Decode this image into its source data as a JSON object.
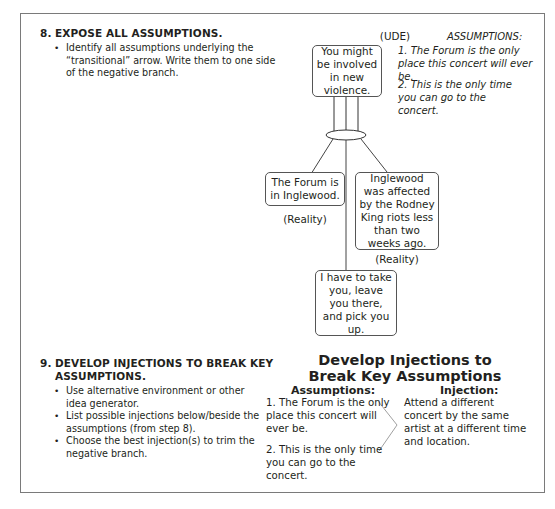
{
  "step8": {
    "number": "8.",
    "title": "EXPOSE ALL ASSUMPTIONS.",
    "bullets": [
      "Identify all assumptions underlying the “transitional” arrow. Write them to one side of the negative branch."
    ]
  },
  "diagram": {
    "ude_label": "(UDE)",
    "ude_box": "You might be involved in new violence.",
    "forum_box": "The Forum is in Inglewood.",
    "forum_tag": "(Reality)",
    "inglewood_box": "Inglewood was affected by the Rodney King riots less than two weeks ago.",
    "inglewood_tag": "(Reality)",
    "bottom_box": "I have to take you, leave you there, and pick you up.",
    "assumptions_heading": "ASSUMPTIONS:",
    "assumptions": [
      "1. The Forum is the only place this concert will ever be.",
      "2. This is the only time you can go to the concert."
    ]
  },
  "step9": {
    "number": "9.",
    "title_line1": "DEVELOP INJECTIONS TO BREAK KEY",
    "title_line2": "ASSUMPTIONS.",
    "bullets": [
      "Use alternative environment or other idea generator.",
      "List possible injections below/beside the assumptions (from step 8).",
      "Choose the best injection(s) to trim the negative branch."
    ]
  },
  "injections": {
    "title_line1": "Develop Injections to",
    "title_line2": "Break Key Assumptions",
    "assumptions_heading": "Assumptions:",
    "injection_heading": "Injection:",
    "assumptions": [
      "1.  The Forum is the only place this concert will ever be.",
      "2.  This is the only time you can go to the concert."
    ],
    "injection": "Attend a different concert by the same artist at a different time and location."
  },
  "colors": {
    "frame": "#7a7a7a",
    "text": "#231f20",
    "connector": "#a0a0a0"
  }
}
